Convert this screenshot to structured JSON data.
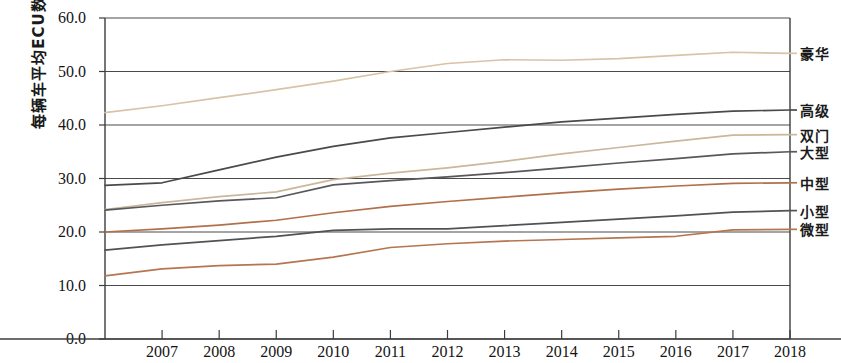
{
  "axes": {
    "ylabel": "每辆车平均ECU数量",
    "yticks": [
      "0.0",
      "10.0",
      "20.0",
      "30.0",
      "40.0",
      "50.0",
      "60.0"
    ],
    "xticks": [
      "2007",
      "2008",
      "2009",
      "2010",
      "2011",
      "2012",
      "2013",
      "2014",
      "2015",
      "2016",
      "2017",
      "2018"
    ]
  },
  "legend": {
    "items": [
      {
        "label": "豪华",
        "color": "#d8c3a8"
      },
      {
        "label": "高级",
        "color": "#4a4a4a"
      },
      {
        "label": "双门",
        "color": "#cbb79b"
      },
      {
        "label": "大型",
        "color": "#58585a"
      },
      {
        "label": "中型",
        "color": "#b2704a"
      },
      {
        "label": "小型",
        "color": "#4f5356"
      },
      {
        "label": "微型",
        "color": "#b5764f"
      }
    ]
  },
  "chart_data": {
    "type": "line",
    "title": "",
    "xlabel": "",
    "ylabel": "每辆车平均ECU数量",
    "xlim": [
      2006,
      2018
    ],
    "ylim": [
      0.0,
      60.0
    ],
    "grid": true,
    "legend_position": "right",
    "x": [
      2006,
      2007,
      2008,
      2009,
      2010,
      2011,
      2012,
      2013,
      2014,
      2015,
      2016,
      2017,
      2018
    ],
    "series": [
      {
        "name": "豪华",
        "color": "#d8c3a8",
        "values": [
          42.3,
          43.6,
          45.1,
          46.6,
          48.2,
          50.0,
          51.5,
          52.2,
          52.1,
          52.4,
          53.0,
          53.6,
          53.4
        ]
      },
      {
        "name": "高级",
        "color": "#4a4a4a",
        "values": [
          28.7,
          29.2,
          31.6,
          34.0,
          36.0,
          37.6,
          38.6,
          39.6,
          40.6,
          41.3,
          42.0,
          42.6,
          42.8
        ]
      },
      {
        "name": "双门",
        "color": "#cbb79b",
        "values": [
          24.2,
          25.5,
          26.6,
          27.5,
          29.8,
          31.0,
          32.0,
          33.2,
          34.6,
          35.8,
          37.0,
          38.1,
          38.2
        ]
      },
      {
        "name": "大型",
        "color": "#58585a",
        "values": [
          24.1,
          25.0,
          25.8,
          26.4,
          28.8,
          29.6,
          30.3,
          31.1,
          32.0,
          32.9,
          33.7,
          34.6,
          35.0
        ]
      },
      {
        "name": "中型",
        "color": "#b2704a",
        "values": [
          20.0,
          20.6,
          21.3,
          22.2,
          23.6,
          24.8,
          25.7,
          26.5,
          27.3,
          28.0,
          28.6,
          29.1,
          29.2
        ]
      },
      {
        "name": "小型",
        "color": "#4f5356",
        "values": [
          16.6,
          17.6,
          18.4,
          19.2,
          20.3,
          20.6,
          20.6,
          21.2,
          21.8,
          22.4,
          23.0,
          23.7,
          24.0
        ]
      },
      {
        "name": "微型",
        "color": "#b5764f",
        "values": [
          11.8,
          13.1,
          13.7,
          14.0,
          15.3,
          17.1,
          17.8,
          18.3,
          18.6,
          18.9,
          19.2,
          20.4,
          20.5
        ]
      }
    ]
  }
}
